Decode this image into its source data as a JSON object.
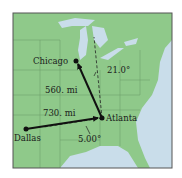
{
  "figure": {
    "cities": [
      {
        "name": "Chicago",
        "x": 76,
        "y": 61
      },
      {
        "name": "Atlanta",
        "x": 102,
        "y": 118
      },
      {
        "name": "Dallas",
        "x": 26,
        "y": 129
      }
    ],
    "vectors": [
      {
        "from": "Atlanta",
        "to": "Chicago",
        "label": "560. mi"
      },
      {
        "from": "Dallas",
        "to": "Atlanta",
        "label": "730. mi"
      }
    ],
    "angles": [
      {
        "label": "21.0°",
        "reference": "vertical dashed line at Atlanta"
      },
      {
        "label": "5.00°",
        "reference": "horizontal dashed line at Atlanta"
      }
    ],
    "colors": {
      "land": "#8fc98a",
      "water": "#c9ddea",
      "border": "#6a9a66",
      "arrow": "#111111",
      "frame": "#555555"
    }
  }
}
